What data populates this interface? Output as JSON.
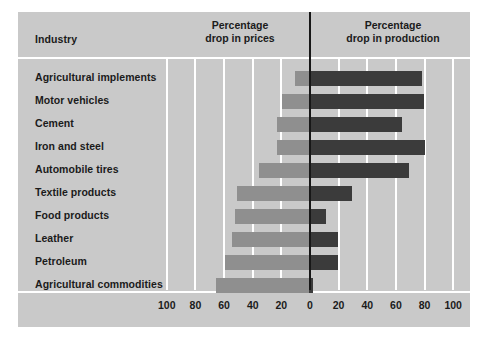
{
  "chart_data": {
    "type": "bar",
    "title": "",
    "subtitle": "",
    "orientation": "horizontal-diverging",
    "category_header": "Industry",
    "left_axis_title": "Percentage\ndrop in prices",
    "left_axis_title_line1": "Percentage",
    "left_axis_title_line2": "drop in prices",
    "right_axis_title_line1": "Percentage",
    "right_axis_title_line2": "drop in production",
    "xlabel": "",
    "ylabel": "",
    "axis_unit": "percent",
    "left_axis_range": [
      0,
      100
    ],
    "right_axis_range": [
      0,
      100
    ],
    "tick_step": 20,
    "tick_labels": [
      "100",
      "80",
      "60",
      "40",
      "20",
      "0",
      "20",
      "40",
      "60",
      "80",
      "100"
    ],
    "tick_values": [
      -100,
      -80,
      -60,
      -40,
      -20,
      0,
      20,
      40,
      60,
      80,
      100
    ],
    "grid": true,
    "legend": "none",
    "categories": [
      "Agricultural implements",
      "Motor vehicles",
      "Cement",
      "Iron and steel",
      "Automobile tires",
      "Textile products",
      "Food products",
      "Leather",
      "Petroleum",
      "Agricultural commodities"
    ],
    "series": [
      {
        "name": "Percentage drop in prices",
        "side": "left",
        "color": "#8f8f8f",
        "values": [
          10,
          19,
          22,
          22,
          35,
          50,
          52,
          54,
          59,
          65
        ]
      },
      {
        "name": "Percentage drop in production",
        "side": "right",
        "color": "#3b3b3b",
        "values": [
          79,
          80,
          65,
          81,
          70,
          30,
          12,
          20,
          20,
          3
        ]
      }
    ],
    "colors": {
      "background": "#c9c9c9",
      "gridline": "#ffffff",
      "zero_line": "#171717",
      "text": "#1b1b1b",
      "prices_bar": "#8f8f8f",
      "production_bar": "#3b3b3b",
      "page": "#ffffff"
    }
  }
}
